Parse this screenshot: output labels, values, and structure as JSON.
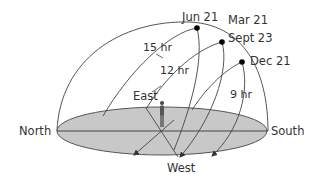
{
  "diagram": {
    "directions": {
      "north": "North",
      "south": "South",
      "east": "East",
      "west": "West"
    },
    "dates": {
      "jun": "Jun 21",
      "mar": "Mar 21",
      "sept": "Sept 23",
      "dec": "Dec 21"
    },
    "durations": {
      "summer": "15 hr",
      "equinox": "12 hr",
      "winter": "9 hr"
    },
    "colors": {
      "ground": "#c8c8c8",
      "line": "#444444",
      "dot": "#000000",
      "text": "#333333"
    }
  }
}
